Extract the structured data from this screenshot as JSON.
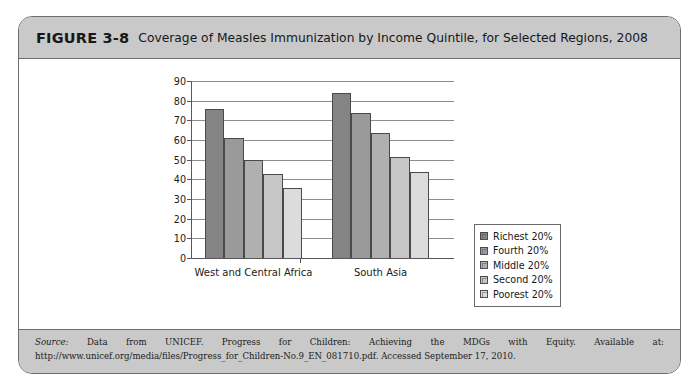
{
  "figure": {
    "number": "FIGURE 3-8",
    "caption": "Coverage of Measles Immunization by Income Quintile, for Selected Regions, 2008"
  },
  "source": {
    "label": "Source:",
    "text": " Data from UNICEF. Progress for Children: Achieving the MDGs with Equity. Available at: http://www.unicef.org/media/files/Progress_for_Children-No.9_EN_081710.pdf. Accessed September 17, 2010."
  },
  "chart_data": {
    "type": "bar",
    "title": "Coverage of Measles Immunization by Income Quintile, for Selected Regions, 2008",
    "xlabel": "",
    "ylabel": "",
    "categories": [
      "West and Central Africa",
      "South Asia"
    ],
    "series": [
      {
        "name": "Richest 20%",
        "values": [
          76,
          84
        ],
        "color": "#848484"
      },
      {
        "name": "Fourth 20%",
        "values": [
          61,
          73.5
        ],
        "color": "#9a9a9a"
      },
      {
        "name": "Middle 20%",
        "values": [
          50,
          63.5
        ],
        "color": "#b0b0b0"
      },
      {
        "name": "Second 20%",
        "values": [
          42.5,
          51.5
        ],
        "color": "#c6c6c6"
      },
      {
        "name": "Poorest 20%",
        "values": [
          35.5,
          43.5
        ],
        "color": "#dcdcdc"
      }
    ],
    "ylim": [
      0,
      90
    ],
    "yticks": [
      0,
      10,
      20,
      30,
      40,
      50,
      60,
      70,
      80,
      90
    ],
    "ytick_labels": [
      "0",
      "10",
      "20",
      "30",
      "40",
      "50",
      "60",
      "70",
      "80",
      "90"
    ],
    "grid": true,
    "legend_position": "right"
  }
}
